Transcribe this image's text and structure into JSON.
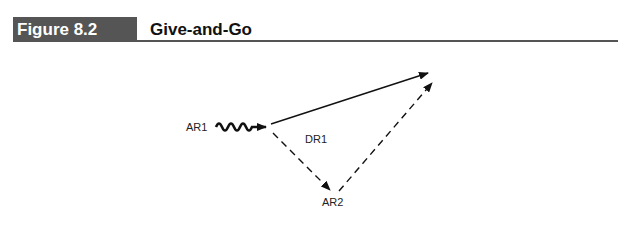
{
  "figure": {
    "number_label": "Figure 8.2",
    "title": "Give-and-Go",
    "colors": {
      "header_box": "#555555",
      "rule": "#555555",
      "lines": "#111111"
    }
  },
  "diagram": {
    "players": [
      {
        "id": "AR1",
        "label": "AR1",
        "role": "attacker with ball"
      },
      {
        "id": "DR1",
        "label": "DR1",
        "role": "defender"
      },
      {
        "id": "AR2",
        "label": "AR2",
        "role": "supporting attacker"
      }
    ],
    "paths": [
      {
        "from": "AR1",
        "type": "dribble",
        "style": "wavy"
      },
      {
        "from": "AR1",
        "type": "run",
        "style": "solid",
        "direction": "forward"
      },
      {
        "from": "AR1",
        "to": "AR2",
        "type": "pass",
        "style": "dashed"
      },
      {
        "from": "AR2",
        "type": "return-pass",
        "style": "dashed",
        "direction": "forward"
      }
    ]
  }
}
